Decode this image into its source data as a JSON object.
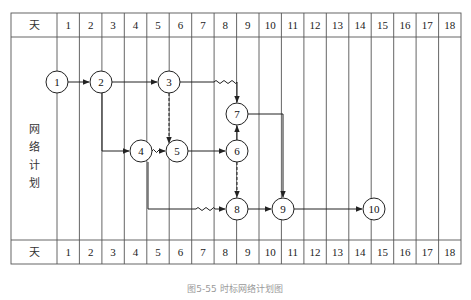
{
  "header": {
    "row_label": "天",
    "days": [
      "1",
      "2",
      "3",
      "4",
      "5",
      "6",
      "7",
      "8",
      "9",
      "10",
      "11",
      "12",
      "13",
      "14",
      "15",
      "16",
      "17",
      "18"
    ]
  },
  "footer": {
    "row_label": "天",
    "days": [
      "1",
      "2",
      "3",
      "4",
      "5",
      "6",
      "7",
      "8",
      "9",
      "10",
      "11",
      "12",
      "13",
      "14",
      "15",
      "16",
      "17",
      "18"
    ]
  },
  "side_label": [
    "网",
    "络",
    "计",
    "划"
  ],
  "caption": "图5-55 时标网络计划图",
  "colors": {
    "line": "#333333",
    "grid": "#555555",
    "caption": "#9a9a9a"
  },
  "nodes": [
    {
      "id": "1",
      "label": "1",
      "x": 57,
      "y": 82
    },
    {
      "id": "2",
      "label": "2",
      "x": 101,
      "y": 82
    },
    {
      "id": "3",
      "label": "3",
      "x": 169,
      "y": 82
    },
    {
      "id": "7",
      "label": "7",
      "x": 237,
      "y": 114
    },
    {
      "id": "4",
      "label": "4",
      "x": 141,
      "y": 151
    },
    {
      "id": "5",
      "label": "5",
      "x": 177,
      "y": 151
    },
    {
      "id": "6",
      "label": "6",
      "x": 237,
      "y": 151
    },
    {
      "id": "8",
      "label": "8",
      "x": 237,
      "y": 209
    },
    {
      "id": "9",
      "label": "9",
      "x": 283,
      "y": 209
    },
    {
      "id": "10",
      "label": "10",
      "x": 374,
      "y": 209
    }
  ],
  "edges": [
    {
      "from": "1",
      "to": "2",
      "type": "solid"
    },
    {
      "from": "2",
      "to": "3",
      "type": "solid"
    },
    {
      "from": "2",
      "to": "4",
      "type": "solid",
      "route": "down-right"
    },
    {
      "from": "3",
      "to": "7",
      "type": "solid-with-free-float",
      "route": "right-down"
    },
    {
      "from": "3",
      "to": "5",
      "type": "dummy-dashed"
    },
    {
      "from": "4",
      "to": "5",
      "type": "free-float-wavy"
    },
    {
      "from": "5",
      "to": "6",
      "type": "solid"
    },
    {
      "from": "6",
      "to": "7",
      "type": "solid"
    },
    {
      "from": "6",
      "to": "8",
      "type": "dummy-dashed"
    },
    {
      "from": "4",
      "to": "8",
      "type": "solid-with-free-float",
      "route": "down-right"
    },
    {
      "from": "7",
      "to": "9",
      "type": "solid",
      "route": "right-down"
    },
    {
      "from": "8",
      "to": "9",
      "type": "solid"
    },
    {
      "from": "9",
      "to": "10",
      "type": "solid"
    }
  ]
}
